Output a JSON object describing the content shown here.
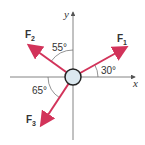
{
  "diagram": {
    "axes": {
      "x_label": "x",
      "y_label": "y"
    },
    "forces": [
      {
        "label": "F",
        "sub": "1",
        "angle_label": "30°"
      },
      {
        "label": "F",
        "sub": "2",
        "angle_label": "55°"
      },
      {
        "label": "F",
        "sub": "3",
        "angle_label": "65°"
      }
    ],
    "colors": {
      "force": "#d2335a",
      "axis": "#555555",
      "body": "#dbe8ef"
    }
  }
}
